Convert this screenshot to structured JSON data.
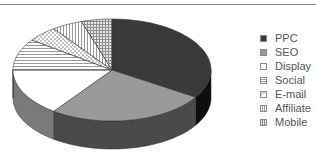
{
  "chart_data": {
    "type": "pie",
    "style": "3d",
    "title": "",
    "categories": [
      "PPC",
      "SEO",
      "Display",
      "Social",
      "E-mail",
      "Affiliate",
      "Mobile"
    ],
    "values": [
      34,
      26,
      15,
      10,
      5,
      5,
      5
    ],
    "unit": "%",
    "start_angle_deg": 90,
    "direction": "clockwise",
    "legend_position": "right",
    "fills": {
      "PPC": {
        "pattern": "solid",
        "color": "#3a3a3a"
      },
      "SEO": {
        "pattern": "solid",
        "color": "#9a9a9a"
      },
      "Display": {
        "pattern": "solid",
        "color": "#ffffff"
      },
      "Social": {
        "pattern": "horizontal-lines",
        "color": "#bbbbbb"
      },
      "E-mail": {
        "pattern": "checker",
        "color": "#cccccc"
      },
      "Affiliate": {
        "pattern": "vertical-lines",
        "color": "#bbbbbb"
      },
      "Mobile": {
        "pattern": "grid",
        "color": "#aaaaaa"
      }
    }
  },
  "legend": {
    "items": [
      {
        "label": "PPC"
      },
      {
        "label": "SEO"
      },
      {
        "label": "Display"
      },
      {
        "label": "Social"
      },
      {
        "label": "E-mail"
      },
      {
        "label": "Affiliate"
      },
      {
        "label": "Mobile"
      }
    ]
  }
}
